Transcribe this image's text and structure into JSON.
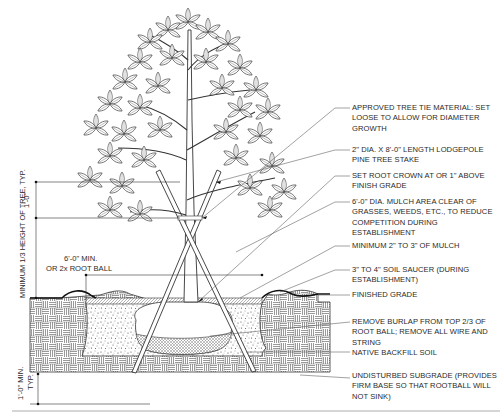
{
  "callouts": [
    {
      "id": "tie",
      "text": "APPROVED TREE TIE MATERIAL: SET LOOSE TO ALLOW FOR DIAMETER GROWTH"
    },
    {
      "id": "stake",
      "text": "2\" DIA. x 8'-0\" LENGTH LODGEPOLE PINE TREE STAKE"
    },
    {
      "id": "crown",
      "text": "SET ROOT CROWN AT OR 1\" ABOVE FINISH GRADE"
    },
    {
      "id": "mulch_area",
      "text": "6'-0\" DIA. MULCH AREA CLEAR OF GRASSES, WEEDS, ETC., TO REDUCE COMPETITION DURING ESTABLISHMENT"
    },
    {
      "id": "mulch_depth",
      "text": "MINIMUM 2\" TO 3\" OF MULCH"
    },
    {
      "id": "saucer",
      "text": "3\" TO 4\" SOIL SAUCER (DURING ESTABLISHMENT)"
    },
    {
      "id": "grade",
      "text": "FINISHED GRADE"
    },
    {
      "id": "burlap",
      "text": "REMOVE BURLAP FROM TOP 2/3 OF ROOT BALL; REMOVE ALL WIRE AND STRING"
    },
    {
      "id": "backfill",
      "text": "NATIVE BACKFILL SOIL"
    },
    {
      "id": "subgrade",
      "text": "UNDISTURBED SUBGRADE (PROVIDES FIRM BASE SO THAT ROOTBALL WILL NOT SINK)"
    }
  ],
  "dimensions": {
    "stake_height": "MINIMUM 1/3 HEIGHT OF TREE, TYP.",
    "tie_spacing": "1'-0\"",
    "pit_width_line1": "6'-0\" MIN.",
    "pit_width_line2": "OR 2x ROOT BALL",
    "subgrade_depth_line1": "1'-0\" MIN.",
    "subgrade_depth_line2": "TYP."
  }
}
